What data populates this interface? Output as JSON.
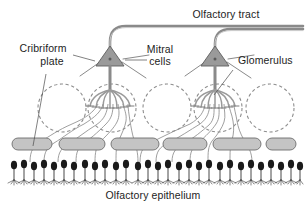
{
  "figure": {
    "background_color": "#ffffff"
  },
  "labels": {
    "olfactory_tract": "Olfactory tract",
    "cribriform_plate_line1": "Cribriform",
    "cribriform_plate_line2": "plate",
    "mitral_cells_line1": "Mitral",
    "mitral_cells_line2": "cells",
    "glomerulus": "Glomerulus",
    "olfactory_epithelium": "Olfactory epithelium"
  },
  "colors": {
    "text": "#1d1d1d",
    "glomerulus_outline": "#8e8e8e",
    "mitral_soma_fill": "#9a9a9a",
    "mitral_soma_stroke": "#5e5e5e",
    "axon": "#8e8e8e",
    "tract": "#8a8a8a",
    "cribriform_plate_fill": "#c4c4c4",
    "cribriform_plate_stroke": "#6e6e6e",
    "receptor_neuron": "#1a1a1a",
    "leader_line": "#4a4a4a"
  },
  "structures": {
    "glomeruli_count": 5,
    "glomeruli_centers_x": [
      62,
      112,
      167,
      218,
      270
    ],
    "glomeruli_center_y": 108,
    "glomeruli_radius": 24,
    "mitral_cells_count": 2,
    "mitral_cell_soma_x": [
      110,
      215
    ],
    "mitral_cell_soma_y": 60,
    "cribriform_plate_segments": 6,
    "cribriform_plate_y": 143,
    "receptor_neuron_count": 29,
    "receptor_row_y": 163
  }
}
